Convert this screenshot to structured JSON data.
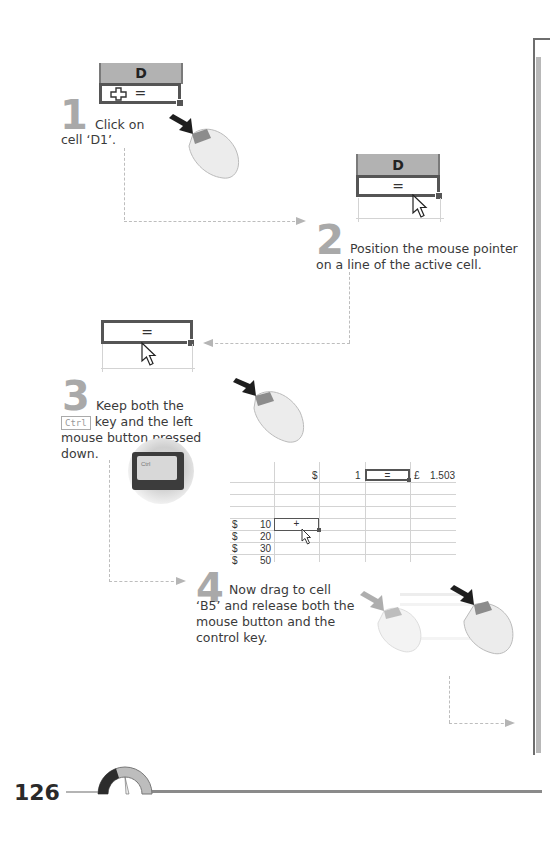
{
  "page": {
    "number": "126"
  },
  "steps": [
    {
      "num": "1",
      "text_lines": [
        "Click on",
        "cell ‘D1’."
      ]
    },
    {
      "num": "2",
      "text_lines": [
        "Position the mouse pointer",
        "on a line of the active cell."
      ]
    },
    {
      "num": "3",
      "text_lines": [
        "Keep both the",
        "key and the left",
        "mouse button pressed",
        "down."
      ],
      "key": "Ctrl"
    },
    {
      "num": "4",
      "text_lines": [
        "Now drag to cell",
        "‘B5’ and release both the",
        "mouse button and the",
        "control key."
      ]
    }
  ],
  "figures": {
    "step1_cell": {
      "column": "D",
      "content": "="
    },
    "step2_cell": {
      "column": "D",
      "content": "="
    },
    "step3_cell": {
      "content": "="
    },
    "ctrl_key_photo_label": "Ctrl",
    "sheet": {
      "row1": {
        "currency": "$",
        "value": "1",
        "active": "=",
        "pound": "£",
        "result": "1.503"
      },
      "drop_cell": "+",
      "rows": [
        {
          "currency": "$",
          "value": "10"
        },
        {
          "currency": "$",
          "value": "20"
        },
        {
          "currency": "$",
          "value": "30"
        },
        {
          "currency": "$",
          "value": "50"
        }
      ]
    }
  },
  "icons": [
    "cross-cursor-icon",
    "arrow-pointer-icon",
    "mouse-icon",
    "ctrl-key-icon",
    "speedometer-icon"
  ],
  "colors": {
    "step_number": "#a9a9a9",
    "column_header": "#b2b2b2",
    "dashed_line": "#bdbdbd"
  }
}
